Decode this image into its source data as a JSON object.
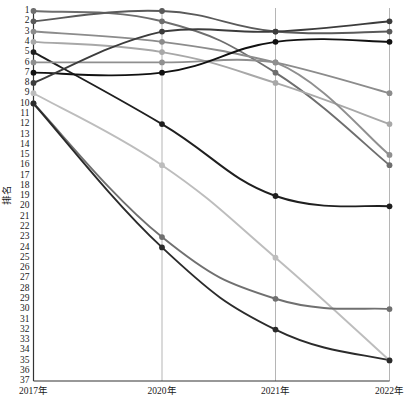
{
  "chart_data": {
    "type": "line",
    "title": "",
    "xlabel": "",
    "ylabel": "排名",
    "x": [
      "2017年",
      "2020年",
      "2021年",
      "2022年"
    ],
    "categories": [
      "2017年",
      "2020年",
      "2021年",
      "2022年"
    ],
    "ylim": [
      1,
      37
    ],
    "y_inverted": true,
    "grid": "vertical-only",
    "legend": "none",
    "ytick_labels": [
      "1",
      "2",
      "3",
      "4",
      "5",
      "6",
      "7",
      "8",
      "9",
      "10",
      "11",
      "12",
      "13",
      "14",
      "15",
      "16",
      "17",
      "18",
      "19",
      "20",
      "21",
      "22",
      "23",
      "24",
      "25",
      "26",
      "27",
      "28",
      "29",
      "30",
      "31",
      "32",
      "33",
      "34",
      "35",
      "36",
      "37"
    ],
    "series": [
      {
        "name": "series-1",
        "values": [
          1,
          2,
          7,
          16
        ],
        "color": "#6e6e6e"
      },
      {
        "name": "series-2",
        "values": [
          2,
          1,
          3,
          3
        ],
        "color": "#5a5a5a"
      },
      {
        "name": "series-3",
        "values": [
          3,
          4,
          6,
          9
        ],
        "color": "#8c8c8c"
      },
      {
        "name": "series-4",
        "values": [
          4,
          5,
          8,
          12
        ],
        "color": "#a8a8a8"
      },
      {
        "name": "series-5",
        "values": [
          5,
          12,
          19,
          20
        ],
        "color": "#1f1f1f"
      },
      {
        "name": "series-6",
        "values": [
          6,
          6,
          6,
          15
        ],
        "color": "#8f8f8f"
      },
      {
        "name": "series-7",
        "values": [
          7,
          7,
          4,
          4
        ],
        "color": "#111111"
      },
      {
        "name": "series-8",
        "values": [
          8,
          3,
          3,
          2
        ],
        "color": "#3c3c3c"
      },
      {
        "name": "series-9",
        "values": [
          9,
          16,
          25,
          35
        ],
        "color": "#bdbdbd"
      },
      {
        "name": "series-10",
        "values": [
          10,
          23,
          29,
          30
        ],
        "color": "#707070"
      },
      {
        "name": "series-11",
        "values": [
          10,
          24,
          32,
          35
        ],
        "color": "#2b2b2b"
      }
    ]
  },
  "axis": {
    "y_title": "排名",
    "x_labels": [
      "2017年",
      "2020年",
      "2021年",
      "2022年"
    ]
  },
  "colors": {
    "axis_line": "#333333",
    "grid_line": "#b5b5b5",
    "background": "#ffffff",
    "tick_text": "#1a1a1a"
  }
}
